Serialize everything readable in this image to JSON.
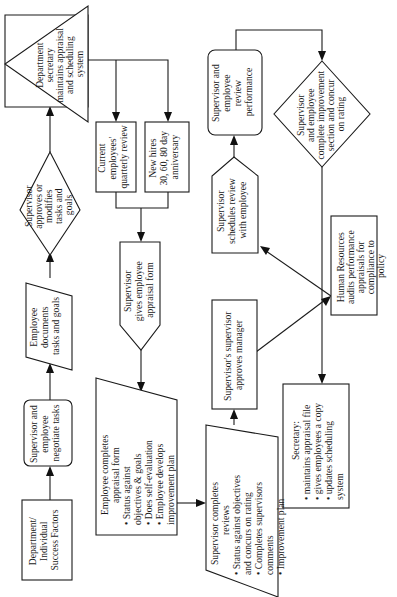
{
  "diagram": {
    "orientation": "rotated-90-ccw",
    "nodes": {
      "success_factors": {
        "shape": "rectangle",
        "lines": [
          "Department/",
          "Individual",
          "Success Factors"
        ]
      },
      "negotiate_tasks": {
        "shape": "rounded-rectangle",
        "lines": [
          "Supervisor and",
          "employee",
          "negotiate tasks"
        ]
      },
      "documents_tasks": {
        "shape": "parallelogram",
        "lines": [
          "Employee",
          "documents",
          "tasks and goals"
        ]
      },
      "approves_tasks": {
        "shape": "diamond",
        "lines": [
          "Supervisor",
          "approves or",
          "modifies",
          "tasks and",
          "goals"
        ]
      },
      "secretary_maintains": {
        "shape": "triangle",
        "lines": [
          "Department",
          "secretary",
          "maintains appraisal",
          "and scheduling",
          "system"
        ]
      },
      "current_employees": {
        "shape": "rectangle",
        "lines": [
          "Current",
          "employees'",
          "quarterly review"
        ]
      },
      "new_hires": {
        "shape": "rectangle",
        "lines": [
          "New hires",
          "30, 60, 80 day",
          "anniversary"
        ]
      },
      "gives_form": {
        "shape": "pentagon",
        "lines": [
          "Supervisor",
          "gives employee",
          "appraisal form"
        ]
      },
      "employee_completes": {
        "shape": "manual-input",
        "lines": [
          "Employee completes",
          "appraisal form",
          "• Status against",
          "  objectives & goals",
          "• Does self-evaluation",
          "• Employee develops",
          "  improvement plan"
        ]
      },
      "supervisor_completes": {
        "shape": "manual-input",
        "lines": [
          "Supervisor completes",
          "reviews",
          "• Status against objectives",
          "  and concurs on rating",
          "• Completes supervisors",
          "  comments",
          "• Improvement plan"
        ]
      },
      "sup_sup_approves": {
        "shape": "rectangle",
        "lines": [
          "Supervisor's supervisor",
          "approves manager"
        ]
      },
      "hr_audits": {
        "shape": "rectangle",
        "lines": [
          "Human Resources",
          "audits performance",
          "appraisals for",
          "compliance to",
          "policy"
        ]
      },
      "schedules_review": {
        "shape": "pentagon",
        "lines": [
          "Supervisor",
          "schedules review",
          "with employee"
        ]
      },
      "review_performance": {
        "shape": "rounded-rectangle",
        "lines": [
          "Supervisor and",
          "employee",
          "review",
          "performance"
        ]
      },
      "improvement_section": {
        "shape": "diamond",
        "lines": [
          "Supervisor",
          "and employee",
          "complete improvement",
          "section and concur",
          "on rating"
        ]
      },
      "secretary_file": {
        "shape": "rectangle",
        "lines": [
          "Secretary:",
          "• maintains appraisal file",
          "• gives employees a copy",
          "• updates scheduling",
          "  system"
        ]
      }
    },
    "edges": [
      [
        "success_factors",
        "negotiate_tasks"
      ],
      [
        "negotiate_tasks",
        "documents_tasks"
      ],
      [
        "documents_tasks",
        "approves_tasks"
      ],
      [
        "approves_tasks",
        "secretary_maintains"
      ],
      [
        "secretary_maintains",
        "current_employees"
      ],
      [
        "secretary_maintains",
        "new_hires"
      ],
      [
        "current_employees",
        "gives_form"
      ],
      [
        "new_hires",
        "gives_form"
      ],
      [
        "gives_form",
        "employee_completes"
      ],
      [
        "employee_completes",
        "supervisor_completes"
      ],
      [
        "supervisor_completes",
        "sup_sup_approves"
      ],
      [
        "sup_sup_approves",
        "hr_audits"
      ],
      [
        "hr_audits",
        "schedules_review"
      ],
      [
        "schedules_review",
        "review_performance"
      ],
      [
        "review_performance",
        "improvement_section"
      ],
      [
        "improvement_section",
        "secretary_file"
      ]
    ]
  }
}
